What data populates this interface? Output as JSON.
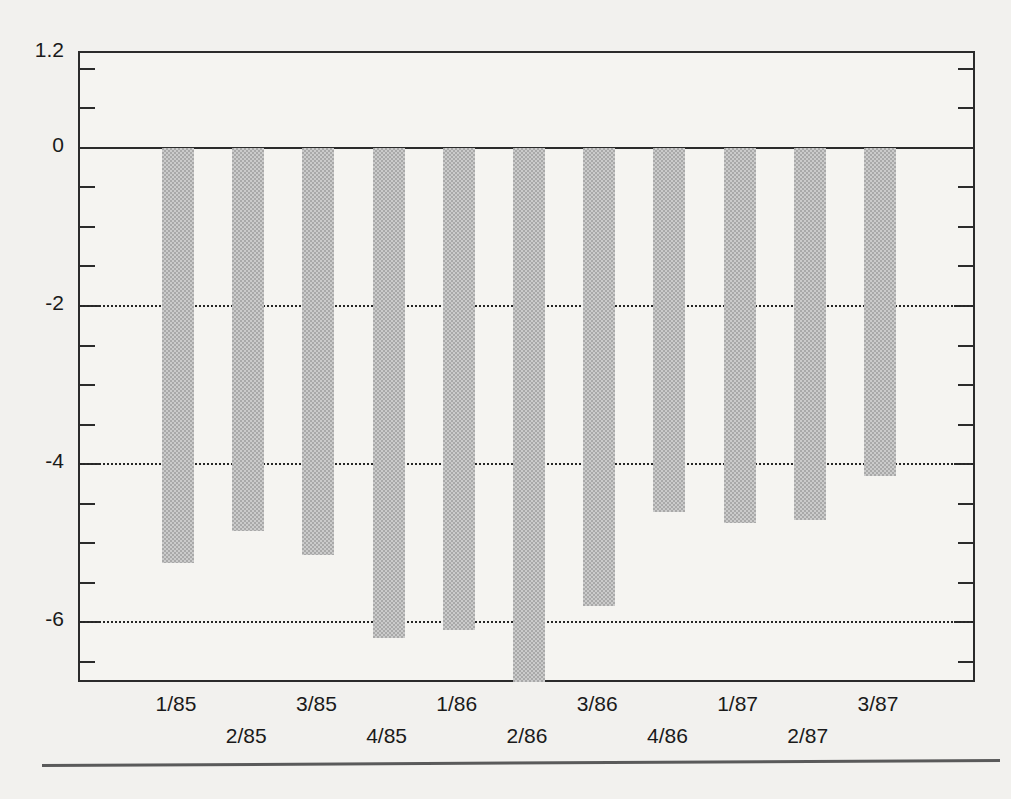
{
  "chart_data": {
    "type": "bar",
    "title": "",
    "subtitle": "",
    "xlabel": "",
    "ylabel": "",
    "categories": [
      "1/85",
      "2/85",
      "3/85",
      "4/85",
      "1/86",
      "2/86",
      "3/86",
      "4/86",
      "1/87",
      "2/87",
      "3/87"
    ],
    "values": [
      -5.25,
      -4.85,
      -5.15,
      -6.2,
      -6.1,
      -6.8,
      -5.8,
      -4.6,
      -4.75,
      -4.7,
      -4.15
    ],
    "series": [
      {
        "name": "",
        "values": [
          -5.25,
          -4.85,
          -5.15,
          -6.2,
          -6.1,
          -6.8,
          -5.8,
          -4.6,
          -4.75,
          -4.7,
          -4.15
        ]
      }
    ],
    "ylim": [
      -6.78,
      1.2
    ],
    "ytick_labels": [
      "1.2",
      "0",
      "-2",
      "-4",
      "-6"
    ],
    "ytick_values": [
      1.2,
      0,
      -2,
      -4,
      -6
    ],
    "minor_tick_interval": 0.5,
    "grid": "horizontal-dotted-at-major-negative-ticks",
    "zero_line": true,
    "legend": "none",
    "bar_color": "#a9a9a9",
    "bar_pattern": "halftone-dither",
    "axis_color": "#2b2b2b",
    "background_color": "#f2f1ee",
    "clipped_bars": [
      "2/86"
    ],
    "annotations": []
  },
  "axis": {
    "y_top_label": "1.2",
    "y_zero_label": "0",
    "y_minus_two_label": "-2",
    "y_minus_four_label": "-4",
    "y_minus_six_label": "-6"
  }
}
